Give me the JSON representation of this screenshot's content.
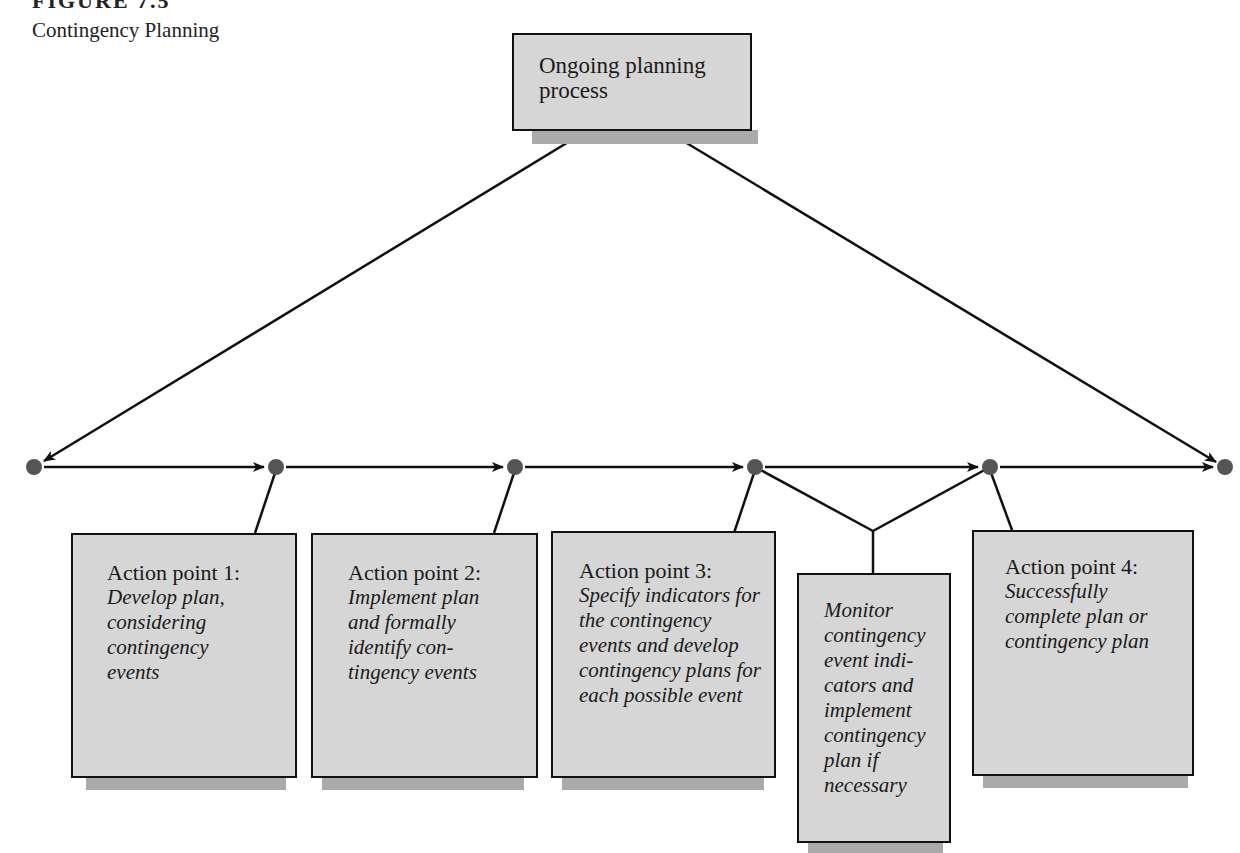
{
  "figure": {
    "label": "FIGURE 7.5",
    "title": "Contingency Planning"
  },
  "top_box": {
    "text": "Ongoing planning process"
  },
  "action_boxes": [
    {
      "head": "Action point 1:",
      "body": "Develop plan, considering contingency events"
    },
    {
      "head": "Action point 2:",
      "body": "Implement plan and formally identify con-tingency events"
    },
    {
      "head": "Action point 3:",
      "body": "Specify indicators for the contingency events and develop contingency plans for each possible event"
    },
    {
      "head": "",
      "body": "Monitor contingency event indi-cators and implement contingency plan if necessary"
    },
    {
      "head": "Action point 4:",
      "body": "Successfully complete plan or contingency plan"
    }
  ],
  "timeline": {
    "node_color": "#555555",
    "nodes_x": [
      34,
      276,
      515,
      755,
      990,
      1225
    ],
    "y": 467
  }
}
